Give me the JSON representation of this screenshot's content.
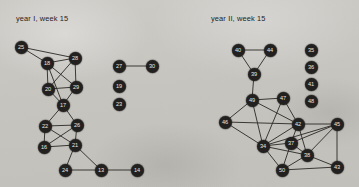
{
  "figure": {
    "background_color": "#c9c7c2",
    "node_color": "#23211f",
    "node_label_color": "#e8e6e1",
    "edge_color": "#2a2825",
    "panels": [
      {
        "id": "year-1",
        "title": "year I, week 15",
        "title_pos": {
          "x": 16,
          "y": 14
        },
        "nodes": [
          {
            "id": "25",
            "x": 21,
            "y": 47
          },
          {
            "id": "18",
            "x": 47,
            "y": 63
          },
          {
            "id": "28",
            "x": 75,
            "y": 58
          },
          {
            "id": "20",
            "x": 48,
            "y": 89
          },
          {
            "id": "29",
            "x": 76,
            "y": 87
          },
          {
            "id": "17",
            "x": 63,
            "y": 105
          },
          {
            "id": "22",
            "x": 45,
            "y": 126
          },
          {
            "id": "26",
            "x": 77,
            "y": 125
          },
          {
            "id": "16",
            "x": 44,
            "y": 147
          },
          {
            "id": "21",
            "x": 75,
            "y": 145
          },
          {
            "id": "24",
            "x": 65,
            "y": 170
          },
          {
            "id": "13",
            "x": 101,
            "y": 170
          },
          {
            "id": "14",
            "x": 137,
            "y": 170
          },
          {
            "id": "27",
            "x": 119,
            "y": 66
          },
          {
            "id": "30",
            "x": 152,
            "y": 66
          },
          {
            "id": "19",
            "x": 119,
            "y": 86
          },
          {
            "id": "23",
            "x": 119,
            "y": 104
          }
        ],
        "edges": [
          [
            "25",
            "18"
          ],
          [
            "25",
            "28"
          ],
          [
            "18",
            "28"
          ],
          [
            "18",
            "20"
          ],
          [
            "18",
            "29"
          ],
          [
            "18",
            "17"
          ],
          [
            "28",
            "20"
          ],
          [
            "28",
            "29"
          ],
          [
            "20",
            "29"
          ],
          [
            "20",
            "17"
          ],
          [
            "29",
            "17"
          ],
          [
            "17",
            "22"
          ],
          [
            "17",
            "26"
          ],
          [
            "22",
            "26"
          ],
          [
            "22",
            "16"
          ],
          [
            "22",
            "21"
          ],
          [
            "26",
            "16"
          ],
          [
            "26",
            "21"
          ],
          [
            "16",
            "21"
          ],
          [
            "21",
            "24"
          ],
          [
            "21",
            "13"
          ],
          [
            "24",
            "13"
          ],
          [
            "13",
            "14"
          ],
          [
            "27",
            "30"
          ]
        ]
      },
      {
        "id": "year-2",
        "title": "year II, week 15",
        "title_pos": {
          "x": 211,
          "y": 14
        },
        "nodes": [
          {
            "id": "40",
            "x": 238,
            "y": 50
          },
          {
            "id": "44",
            "x": 270,
            "y": 50
          },
          {
            "id": "39",
            "x": 254,
            "y": 74
          },
          {
            "id": "49",
            "x": 252,
            "y": 100
          },
          {
            "id": "47",
            "x": 283,
            "y": 98
          },
          {
            "id": "46",
            "x": 225,
            "y": 122
          },
          {
            "id": "42",
            "x": 298,
            "y": 124
          },
          {
            "id": "34",
            "x": 263,
            "y": 146
          },
          {
            "id": "37",
            "x": 291,
            "y": 143
          },
          {
            "id": "38",
            "x": 307,
            "y": 155
          },
          {
            "id": "50",
            "x": 282,
            "y": 170
          },
          {
            "id": "45",
            "x": 337,
            "y": 124
          },
          {
            "id": "43",
            "x": 337,
            "y": 167
          },
          {
            "id": "35",
            "x": 311,
            "y": 50
          },
          {
            "id": "36",
            "x": 311,
            "y": 67
          },
          {
            "id": "41",
            "x": 311,
            "y": 84
          },
          {
            "id": "48",
            "x": 311,
            "y": 101
          }
        ],
        "edges": [
          [
            "40",
            "44"
          ],
          [
            "40",
            "39"
          ],
          [
            "44",
            "39"
          ],
          [
            "39",
            "49"
          ],
          [
            "49",
            "47"
          ],
          [
            "49",
            "46"
          ],
          [
            "49",
            "34"
          ],
          [
            "49",
            "42"
          ],
          [
            "47",
            "42"
          ],
          [
            "47",
            "34"
          ],
          [
            "46",
            "34"
          ],
          [
            "46",
            "42"
          ],
          [
            "42",
            "34"
          ],
          [
            "42",
            "45"
          ],
          [
            "42",
            "37"
          ],
          [
            "42",
            "38"
          ],
          [
            "34",
            "37"
          ],
          [
            "34",
            "50"
          ],
          [
            "34",
            "38"
          ],
          [
            "37",
            "50"
          ],
          [
            "37",
            "38"
          ],
          [
            "38",
            "50"
          ],
          [
            "38",
            "45"
          ],
          [
            "38",
            "43"
          ],
          [
            "50",
            "43"
          ],
          [
            "45",
            "43"
          ],
          [
            "45",
            "34"
          ],
          [
            "45",
            "37"
          ]
        ]
      }
    ]
  }
}
